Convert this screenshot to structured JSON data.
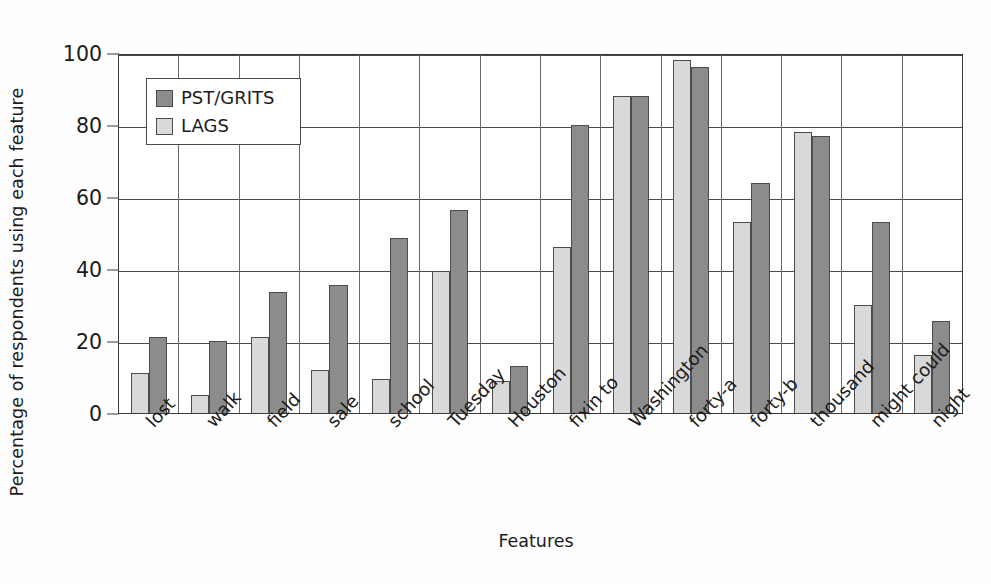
{
  "chart_data": {
    "type": "bar",
    "title": "",
    "xlabel": "Features",
    "ylabel": "Percentage of respondents using each feature",
    "ylim": [
      0,
      100
    ],
    "yticks": [
      0,
      20,
      40,
      60,
      80,
      100
    ],
    "grid": true,
    "legend_position": "upper-left-inside",
    "categories": [
      "lost",
      "walk",
      "field",
      "sale",
      "school",
      "Tuesday",
      "Houston",
      "fixin to",
      "Washington",
      "forty-a",
      "forty-b",
      "thousand",
      "might could",
      "night"
    ],
    "series": [
      {
        "name": "LAGS",
        "color": "#d9d9d9",
        "values": [
          11,
          5,
          21,
          12,
          9.5,
          39.5,
          9,
          46,
          88,
          98,
          53,
          78,
          30,
          16
        ]
      },
      {
        "name": "PST/GRITS",
        "color": "#8c8c8c",
        "values": [
          21,
          20,
          33.5,
          35.5,
          48.5,
          56.5,
          13,
          80,
          88,
          96,
          64,
          77,
          53,
          25.5
        ]
      }
    ],
    "series_draw_order": [
      "LAGS",
      "PST/GRITS"
    ],
    "legend": [
      {
        "label": "PST/GRITS",
        "color": "#8c8c8c"
      },
      {
        "label": "LAGS",
        "color": "#d9d9d9"
      }
    ]
  }
}
